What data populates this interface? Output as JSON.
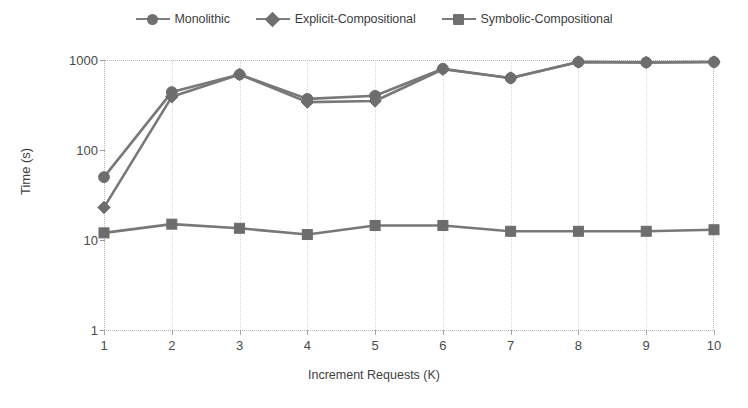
{
  "chart_data": {
    "type": "line",
    "title": "",
    "xlabel": "Increment Requests (K)",
    "ylabel": "Time (s)",
    "x": [
      1,
      2,
      3,
      4,
      5,
      6,
      7,
      8,
      9,
      10
    ],
    "categories": [
      "1",
      "2",
      "3",
      "4",
      "5",
      "6",
      "7",
      "8",
      "9",
      "10"
    ],
    "xtick_labels": [
      "1",
      "2",
      "3",
      "4",
      "5",
      "6",
      "7",
      "8",
      "9",
      "10"
    ],
    "ytick_labels": [
      "1",
      "10",
      "100",
      "1000"
    ],
    "ytick_values": [
      1,
      10,
      100,
      1000
    ],
    "yscale": "log",
    "ylim": [
      1,
      1000
    ],
    "xlim": [
      1,
      10
    ],
    "grid": true,
    "legend_position": "top",
    "series": [
      {
        "name": "Monolithic",
        "marker": "circle",
        "color": "#6d6d6d",
        "values": [
          50,
          440,
          690,
          370,
          400,
          800,
          630,
          950,
          940,
          950
        ]
      },
      {
        "name": "Explicit-Compositional",
        "marker": "diamond",
        "color": "#6d6d6d",
        "values": [
          23,
          390,
          690,
          340,
          350,
          790,
          630,
          950,
          940,
          950
        ]
      },
      {
        "name": "Symbolic-Compositional",
        "marker": "square",
        "color": "#6d6d6d",
        "values": [
          12,
          15,
          13.5,
          11.5,
          14.5,
          14.5,
          12.5,
          12.5,
          12.5,
          13
        ]
      }
    ]
  },
  "legend": {
    "items": [
      {
        "label": "Monolithic",
        "marker": "circle"
      },
      {
        "label": "Explicit-Compositional",
        "marker": "diamond"
      },
      {
        "label": "Symbolic-Compositional",
        "marker": "square"
      }
    ]
  },
  "axes": {
    "y_title": "Time (s)",
    "x_title": "Increment Requests (K)"
  }
}
